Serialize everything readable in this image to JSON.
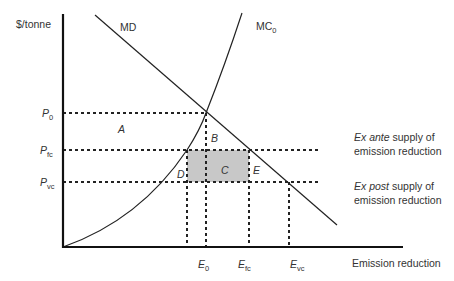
{
  "axes": {
    "y_label": "$/tonne",
    "x_label": "Emission reduction"
  },
  "curves": {
    "md_label": "MD",
    "mc_label_main": "MC",
    "mc_label_sub": "0"
  },
  "price_levels": [
    {
      "main": "P",
      "sub": "0",
      "y": 113
    },
    {
      "main": "P",
      "sub": "fc",
      "y": 150
    },
    {
      "main": "P",
      "sub": "vc",
      "y": 182
    }
  ],
  "quantity_levels": [
    {
      "main": "E",
      "sub": "0",
      "x": 206
    },
    {
      "main": "E",
      "sub": "fc",
      "x": 249
    },
    {
      "main": "E",
      "sub": "vc",
      "x": 289
    }
  ],
  "areas": {
    "a": "A",
    "b": "B",
    "c": "C",
    "d": "D",
    "e": "E"
  },
  "annotations": {
    "ex_ante_italic": "Ex ante",
    "ex_ante_rest": " supply of",
    "ex_ante_line2": "emission reduction",
    "ex_post_italic": "Ex post",
    "ex_post_rest": " supply of",
    "ex_post_line2": "emission reduction"
  },
  "colors": {
    "line": "#222222",
    "shaded": "#c8c8c8"
  }
}
